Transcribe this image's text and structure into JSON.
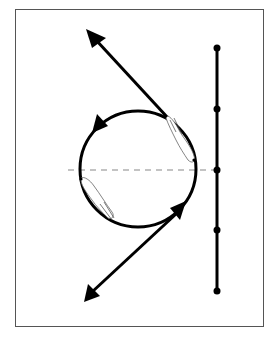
{
  "diagram": {
    "type": "riding-figure",
    "colors": {
      "stroke": "#000000",
      "dashed_guide": "#b0b0b0",
      "frame": "#555555",
      "horse_outline": "#666666"
    },
    "circle": {
      "cx": 138,
      "cy": 169,
      "r": 58,
      "direction": "counter-clockwise"
    },
    "entry_line": {
      "from": [
        85,
        298
      ],
      "to": [
        180,
        210
      ],
      "tail_marker": "triangle"
    },
    "exit_line": {
      "from": [
        168,
        118
      ],
      "to": [
        86,
        29
      ],
      "head": "arrow"
    },
    "circle_arrows": [
      {
        "name": "top-left-arrow",
        "at": [
          95,
          123
        ]
      },
      {
        "name": "bottom-right-arrow",
        "at": [
          178,
          208
        ]
      }
    ],
    "guide_line": {
      "style": "dashed",
      "y": 170,
      "x1": 68,
      "x2": 215
    },
    "pole_line": {
      "x": 217,
      "y1": 48,
      "y2": 291,
      "points_y": [
        48,
        109,
        170,
        230,
        291
      ]
    },
    "horses": [
      {
        "name": "horse-right",
        "position": "right side of circle, head up"
      },
      {
        "name": "horse-left",
        "position": "left side of circle, head down"
      }
    ]
  }
}
